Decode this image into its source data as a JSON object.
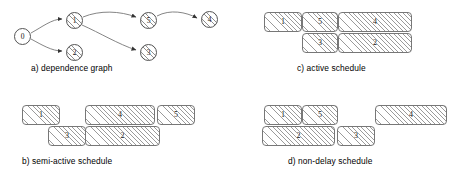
{
  "figure": {
    "panels": [
      {
        "id": "panel-a",
        "caption": "a) dependence graph",
        "type": "graph",
        "nodes": [
          {
            "id": "0",
            "label": "0",
            "x": 14,
            "y": 28,
            "hatched": false
          },
          {
            "id": "1",
            "label": "1",
            "x": 66,
            "y": 12,
            "hatched": true
          },
          {
            "id": "2",
            "label": "2",
            "x": 66,
            "y": 44,
            "hatched": true
          },
          {
            "id": "5",
            "label": "5",
            "x": 140,
            "y": 12,
            "hatched": true
          },
          {
            "id": "3",
            "label": "3",
            "x": 140,
            "y": 44,
            "hatched": true
          },
          {
            "id": "4",
            "label": "4",
            "x": 201,
            "y": 11,
            "hatched": true
          }
        ],
        "edges": [
          {
            "from": "0",
            "to": "1"
          },
          {
            "from": "0",
            "to": "2"
          },
          {
            "from": "1",
            "to": "5"
          },
          {
            "from": "1",
            "to": "3"
          },
          {
            "from": "5",
            "to": "4"
          }
        ]
      },
      {
        "id": "panel-b",
        "caption": "b) semi-active schedule",
        "type": "schedule",
        "blocks": [
          {
            "label": "1",
            "x": 22,
            "y": 105,
            "w": 38,
            "h": 20,
            "row": 0
          },
          {
            "label": "4",
            "x": 85,
            "y": 105,
            "w": 70,
            "h": 20,
            "row": 0
          },
          {
            "label": "5",
            "x": 157,
            "y": 105,
            "w": 38,
            "h": 20,
            "row": 0
          },
          {
            "label": "3",
            "x": 48,
            "y": 126,
            "w": 38,
            "h": 20,
            "row": 1
          },
          {
            "label": "2",
            "x": 85,
            "y": 126,
            "w": 75,
            "h": 20,
            "row": 1
          }
        ]
      },
      {
        "id": "panel-c",
        "caption": "c) active schedule",
        "type": "schedule",
        "blocks": [
          {
            "label": "1",
            "x": 264,
            "y": 12,
            "w": 38,
            "h": 20,
            "row": 0
          },
          {
            "label": "5",
            "x": 302,
            "y": 12,
            "w": 36,
            "h": 20,
            "row": 0
          },
          {
            "label": "4",
            "x": 338,
            "y": 12,
            "w": 74,
            "h": 20,
            "row": 0
          },
          {
            "label": "3",
            "x": 302,
            "y": 33,
            "w": 36,
            "h": 20,
            "row": 1
          },
          {
            "label": "2",
            "x": 338,
            "y": 33,
            "w": 74,
            "h": 20,
            "row": 1
          }
        ]
      },
      {
        "id": "panel-d",
        "caption": "d) non-delay schedule",
        "type": "schedule",
        "blocks": [
          {
            "label": "1",
            "x": 264,
            "y": 105,
            "w": 38,
            "h": 20,
            "row": 0
          },
          {
            "label": "5",
            "x": 302,
            "y": 105,
            "w": 36,
            "h": 20,
            "row": 0
          },
          {
            "label": "4",
            "x": 375,
            "y": 105,
            "w": 72,
            "h": 20,
            "row": 0
          },
          {
            "label": "2",
            "x": 262,
            "y": 126,
            "w": 73,
            "h": 20,
            "row": 1
          },
          {
            "label": "3",
            "x": 337,
            "y": 126,
            "w": 38,
            "h": 20,
            "row": 1
          }
        ]
      }
    ],
    "captions": {
      "a": {
        "text": "a) dependence graph",
        "x": 31,
        "y": 63
      },
      "b": {
        "text": "b) semi-active schedule",
        "x": 22,
        "y": 156
      },
      "c": {
        "text": "c) active schedule",
        "x": 297,
        "y": 63
      },
      "d": {
        "text": "d) non-delay schedule",
        "x": 288,
        "y": 156
      }
    },
    "colors": {
      "stroke": "#555555",
      "hatch": "#9a9a9a",
      "text": "#111111",
      "background": "#ffffff"
    }
  }
}
